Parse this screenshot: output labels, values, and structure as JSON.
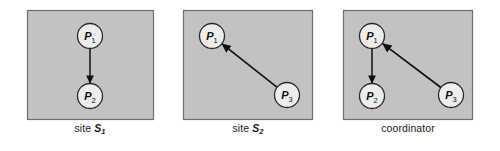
{
  "figure": {
    "background": "#ffffff",
    "panel_fill": "#c2c2c2",
    "panel_stroke": "#6d6d6d",
    "node_fill": "#ededed",
    "node_stroke": "#2a2a2a",
    "arrow_color": "#111111",
    "label_color": "#1b1b1b"
  },
  "panels": [
    {
      "id": "site-s1",
      "caption_text": "site S1",
      "caption_prefix": "site ",
      "caption_symbol": "S",
      "caption_subscript": "1",
      "box": {
        "x": 27,
        "y": 10,
        "w": 127,
        "h": 110
      },
      "nodes": [
        {
          "id": "p1",
          "label_letter": "P",
          "label_subscript": "1",
          "cx": 90,
          "cy": 36,
          "r": 12.5
        },
        {
          "id": "p2",
          "label_letter": "P",
          "label_subscript": "2",
          "cx": 90,
          "cy": 96,
          "r": 12.5
        }
      ],
      "arrows": [
        {
          "id": "p1-to-p2",
          "from": "p1",
          "to": "p2",
          "x1": 90,
          "y1": 48.5,
          "x2": 90,
          "y2": 83.5
        }
      ]
    },
    {
      "id": "site-s2",
      "caption_text": "site S2",
      "caption_prefix": "site ",
      "caption_symbol": "S",
      "caption_subscript": "2",
      "box": {
        "x": 183,
        "y": 10,
        "w": 130,
        "h": 110
      },
      "nodes": [
        {
          "id": "p1",
          "label_letter": "P",
          "label_subscript": "1",
          "cx": 212,
          "cy": 36,
          "r": 12.5
        },
        {
          "id": "p3",
          "label_letter": "P",
          "label_subscript": "3",
          "cx": 287,
          "cy": 95,
          "r": 12.5
        }
      ],
      "arrows": [
        {
          "id": "p3-to-p1",
          "from": "p3",
          "to": "p1",
          "x1": 277.2,
          "y1": 87.3,
          "x2": 221.8,
          "y2": 43.7
        }
      ]
    },
    {
      "id": "coordinator",
      "caption_text": "coordinator",
      "caption_prefix": "coordinator",
      "caption_symbol": "",
      "caption_subscript": "",
      "box": {
        "x": 343,
        "y": 10,
        "w": 130,
        "h": 110
      },
      "nodes": [
        {
          "id": "p1",
          "label_letter": "P",
          "label_subscript": "1",
          "cx": 372,
          "cy": 36,
          "r": 12.5
        },
        {
          "id": "p2",
          "label_letter": "P",
          "label_subscript": "2",
          "cx": 372,
          "cy": 96,
          "r": 12.5
        },
        {
          "id": "p3",
          "label_letter": "P",
          "label_subscript": "3",
          "cx": 451,
          "cy": 95,
          "r": 12.5
        }
      ],
      "arrows": [
        {
          "id": "p1-to-p2",
          "from": "p1",
          "to": "p2",
          "x1": 372,
          "y1": 48.5,
          "x2": 372,
          "y2": 83.5
        },
        {
          "id": "p3-to-p1",
          "from": "p3",
          "to": "p1",
          "x1": 441.2,
          "y1": 87.8,
          "x2": 382.2,
          "y2": 43.2
        }
      ]
    }
  ],
  "captions": [
    {
      "x": 90,
      "y": 128
    },
    {
      "x": 248,
      "y": 128
    },
    {
      "x": 408,
      "y": 128
    }
  ]
}
